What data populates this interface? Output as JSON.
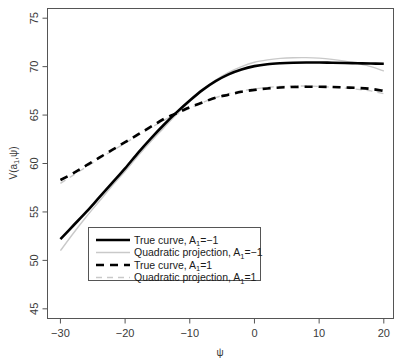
{
  "chart_data": {
    "type": "line",
    "title": "",
    "xlabel": "ψ",
    "ylabel": "V(a₁,ψ)",
    "xlim": [
      -32,
      21.5
    ],
    "ylim": [
      44,
      76
    ],
    "xticks": [
      -30,
      -20,
      -10,
      0,
      10,
      20
    ],
    "xticklabels": [
      "−30",
      "−20",
      "−10",
      "0",
      "10",
      "20"
    ],
    "yticks": [
      45,
      50,
      55,
      60,
      65,
      70,
      75
    ],
    "yticklabels": [
      "45",
      "50",
      "55",
      "60",
      "65",
      "70",
      "75"
    ],
    "grid": false,
    "legend_position": "bottom-left-inside",
    "x": [
      -30,
      -28,
      -26,
      -24,
      -22,
      -20,
      -18,
      -16,
      -14,
      -12,
      -10,
      -8,
      -6,
      -4,
      -2,
      0,
      2,
      4,
      6,
      8,
      10,
      12,
      14,
      16,
      18,
      20
    ],
    "series": [
      {
        "name": "True curve, A₁=−1",
        "style": "solid",
        "color": "#000000",
        "width": 2.6,
        "values": [
          52.2,
          53.6,
          55.0,
          56.5,
          58.0,
          59.5,
          61.1,
          62.6,
          64.0,
          65.3,
          66.5,
          67.6,
          68.5,
          69.2,
          69.7,
          70.05,
          70.25,
          70.35,
          70.4,
          70.42,
          70.42,
          70.4,
          70.38,
          70.35,
          70.32,
          70.3
        ]
      },
      {
        "name": "Quadratic projection, A₁=−1",
        "style": "solid",
        "color": "#c9c9c9",
        "width": 1.4,
        "values": [
          51.0,
          52.8,
          54.5,
          56.1,
          57.7,
          59.2,
          60.8,
          62.3,
          63.7,
          65.1,
          66.4,
          67.6,
          68.6,
          69.4,
          70.0,
          70.45,
          70.7,
          70.85,
          70.92,
          70.93,
          70.88,
          70.75,
          70.55,
          70.3,
          70.0,
          69.55
        ]
      },
      {
        "name": "True curve, A₁=1",
        "style": "dashed",
        "color": "#000000",
        "width": 2.6,
        "values": [
          58.3,
          59.0,
          59.8,
          60.6,
          61.4,
          62.2,
          63.0,
          63.8,
          64.6,
          65.2,
          65.8,
          66.3,
          66.8,
          67.1,
          67.4,
          67.6,
          67.75,
          67.85,
          67.9,
          67.92,
          67.92,
          67.9,
          67.85,
          67.8,
          67.7,
          67.5
        ]
      },
      {
        "name": "Quadratic projection, A₁=1",
        "style": "dashed",
        "color": "#c9c9c9",
        "width": 1.4,
        "values": [
          57.95,
          58.8,
          59.65,
          60.5,
          61.3,
          62.1,
          62.9,
          63.7,
          64.45,
          65.1,
          65.7,
          66.3,
          66.8,
          67.2,
          67.5,
          67.7,
          67.85,
          67.95,
          68.0,
          68.0,
          67.95,
          67.88,
          67.78,
          67.65,
          67.5,
          67.2
        ]
      }
    ]
  },
  "legend": {
    "entries": [
      {
        "main": "True curve, A",
        "sub": "1",
        "tail": "=−1"
      },
      {
        "main": "Quadratic projection, A",
        "sub": "1",
        "tail": "=−1"
      },
      {
        "main": "True curve, A",
        "sub": "1",
        "tail": "=1"
      },
      {
        "main": "Quadratic projection, A",
        "sub": "1",
        "tail": "=1"
      }
    ]
  },
  "axis": {
    "y_label_main": "V(a",
    "y_label_sub": "1",
    "y_label_tail": ",ψ)",
    "x_label": "ψ"
  },
  "colors": {
    "true_curve": "#000000",
    "quadratic_projection": "#c9c9c9",
    "axis": "#555555",
    "background": "#ffffff"
  }
}
